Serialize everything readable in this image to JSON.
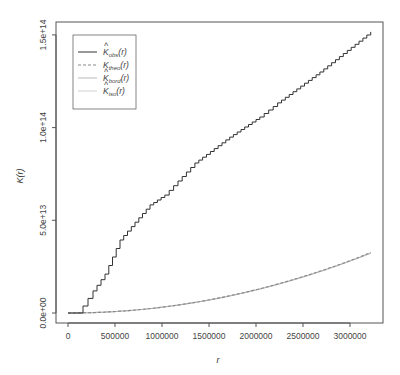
{
  "chart_data": {
    "type": "line",
    "title": "",
    "xlabel": "r",
    "ylabel": "K(r)",
    "xlim": [
      0,
      3220000
    ],
    "ylim": [
      0,
      152000000000000
    ],
    "x_ticks": [
      0,
      500000,
      1000000,
      1500000,
      2000000,
      2500000,
      3000000
    ],
    "x_tick_labels": [
      "0",
      "500000",
      "1000000",
      "1500000",
      "2000000",
      "2500000",
      "3000000"
    ],
    "y_ticks": [
      0,
      50000000000000,
      100000000000000,
      150000000000000
    ],
    "y_tick_labels": [
      "0.0e+00",
      "5.0e+13",
      "1.0e+14",
      "1.5e+14"
    ],
    "grid": false,
    "legend_position": "top-left",
    "series": [
      {
        "name": "K̂obs(r)",
        "legend_main": "K",
        "legend_sub": "obs",
        "hat": true,
        "style": "solid",
        "color": "#333333",
        "x": [
          0,
          106000,
          160000,
          266000,
          394000,
          553000,
          713000,
          872000,
          1030000,
          1170000,
          1350000,
          1720000,
          2040000,
          2230000,
          2680000,
          3220000
        ],
        "y": [
          0,
          0,
          3800000000000,
          11900000000000,
          21000000000000,
          39400000000000,
          49000000000000,
          58300000000000,
          63600000000000,
          71200000000000,
          80900000000000,
          94900000000000,
          105700000000000,
          113300000000000,
          130000000000000,
          151600000000000
        ]
      },
      {
        "name": "Ktheo(r)",
        "legend_main": "K",
        "legend_sub": "theo",
        "hat": false,
        "style": "dashed",
        "color": "#888888",
        "x": [
          0,
          500000,
          1000000,
          1500000,
          2000000,
          2500000,
          3000000,
          3220000
        ],
        "y": [
          0,
          785000000000,
          3140000000000,
          7070000000000,
          12570000000000,
          19630000000000,
          28270000000000,
          32570000000000
        ]
      },
      {
        "name": "K̂bord(r)",
        "legend_main": "K",
        "legend_sub": "bord",
        "hat": true,
        "style": "solid",
        "color": "#b8b8b8",
        "x": [
          0,
          500000,
          1000000,
          1500000,
          2000000,
          2500000,
          3000000,
          3220000
        ],
        "y": [
          0,
          800000000000,
          3200000000000,
          7150000000000,
          12650000000000,
          19700000000000,
          28200000000000,
          32300000000000
        ]
      },
      {
        "name": "K̂iso(r)",
        "legend_main": "K",
        "legend_sub": "iso",
        "hat": true,
        "style": "solid",
        "color": "#d0d0d0",
        "x": [
          0,
          500000,
          1000000,
          1500000,
          2000000,
          2500000,
          3000000,
          3220000
        ],
        "y": [
          0,
          790000000000,
          3160000000000,
          7100000000000,
          12600000000000,
          19650000000000,
          28150000000000,
          32200000000000
        ]
      }
    ]
  }
}
